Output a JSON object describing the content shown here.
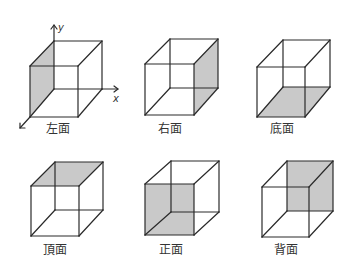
{
  "cubes": [
    {
      "label": "左面",
      "shaded_face": "left",
      "front": [
        30,
        66,
        78,
        117
      ],
      "back": [
        54,
        41,
        102,
        89
      ],
      "label_pos": [
        46,
        133
      ]
    },
    {
      "label": "右面",
      "shaded_face": "right",
      "front": [
        145,
        64,
        194,
        115
      ],
      "back": [
        170,
        39,
        218,
        88
      ],
      "label_pos": [
        158,
        133
      ]
    },
    {
      "label": "底面",
      "shaded_face": "bottom",
      "front": [
        257,
        67,
        305,
        117
      ],
      "back": [
        283,
        40,
        330,
        87
      ],
      "label_pos": [
        270,
        133
      ]
    },
    {
      "label": "頂面",
      "shaded_face": "top",
      "front": [
        31,
        186,
        79,
        236
      ],
      "back": [
        55,
        162,
        103,
        210
      ],
      "label_pos": [
        43,
        254
      ]
    },
    {
      "label": "正面",
      "shaded_face": "front",
      "front": [
        145,
        184,
        194,
        235
      ],
      "back": [
        171,
        161,
        219,
        212
      ],
      "label_pos": [
        159,
        254
      ]
    },
    {
      "label": "背面",
      "shaded_face": "back",
      "front": [
        262,
        187,
        309,
        237
      ],
      "back": [
        287,
        161,
        333,
        211
      ],
      "label_pos": [
        274,
        254
      ]
    }
  ],
  "axes": {
    "y_label": "y",
    "x_label": "x"
  },
  "colors": {
    "line": "#2a2a2a",
    "shade": "#c9c9c9"
  }
}
